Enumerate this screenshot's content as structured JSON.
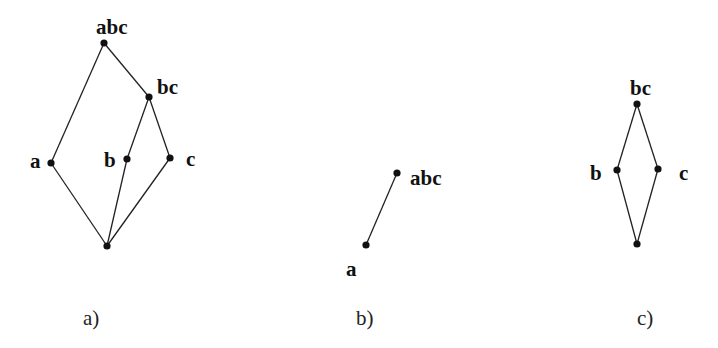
{
  "diagrams": [
    {
      "id": "a",
      "caption": "a)",
      "caption_pos": [
        83,
        325
      ],
      "nodes": [
        {
          "id": "abc",
          "label": "abc",
          "x": 104,
          "y": 43,
          "lx": 96,
          "ly": 34
        },
        {
          "id": "bc",
          "label": "bc",
          "x": 149,
          "y": 97,
          "lx": 157,
          "ly": 94
        },
        {
          "id": "a",
          "label": "a",
          "x": 51,
          "y": 163,
          "lx": 30,
          "ly": 168
        },
        {
          "id": "b",
          "label": "b",
          "x": 127,
          "y": 159,
          "lx": 104,
          "ly": 167
        },
        {
          "id": "c",
          "label": "c",
          "x": 170,
          "y": 158,
          "lx": 186,
          "ly": 166
        },
        {
          "id": "bottom",
          "label": "",
          "x": 107,
          "y": 246,
          "lx": 0,
          "ly": 0
        }
      ],
      "edges": [
        [
          "abc",
          "a"
        ],
        [
          "abc",
          "bc"
        ],
        [
          "bc",
          "b"
        ],
        [
          "bc",
          "c"
        ],
        [
          "a",
          "bottom"
        ],
        [
          "b",
          "bottom"
        ],
        [
          "c",
          "bottom"
        ]
      ]
    },
    {
      "id": "b",
      "caption": "b)",
      "caption_pos": [
        356,
        325
      ],
      "nodes": [
        {
          "id": "abc",
          "label": "abc",
          "x": 397,
          "y": 173,
          "lx": 410,
          "ly": 185
        },
        {
          "id": "a",
          "label": "a",
          "x": 366,
          "y": 245,
          "lx": 346,
          "ly": 276
        }
      ],
      "edges": [
        [
          "abc",
          "a"
        ]
      ]
    },
    {
      "id": "c",
      "caption": "c)",
      "caption_pos": [
        637,
        325
      ],
      "nodes": [
        {
          "id": "bc",
          "label": "bc",
          "x": 637,
          "y": 104,
          "lx": 630,
          "ly": 95
        },
        {
          "id": "b",
          "label": "b",
          "x": 617,
          "y": 170,
          "lx": 590,
          "ly": 180
        },
        {
          "id": "c",
          "label": "c",
          "x": 658,
          "y": 169,
          "lx": 679,
          "ly": 180
        },
        {
          "id": "bottom",
          "label": "",
          "x": 637,
          "y": 244,
          "lx": 0,
          "ly": 0
        }
      ],
      "edges": [
        [
          "bc",
          "b"
        ],
        [
          "bc",
          "c"
        ],
        [
          "b",
          "bottom"
        ],
        [
          "c",
          "bottom"
        ]
      ]
    }
  ]
}
